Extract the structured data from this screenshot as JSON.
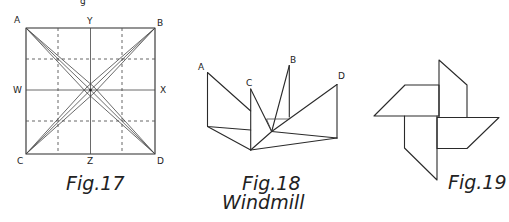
{
  "page": {
    "top_fragment": "g",
    "colors": {
      "ink": "#2a2a2a",
      "paper": "#ffffff"
    }
  },
  "figures": [
    {
      "id": "fig17",
      "caption": "Fig.17",
      "subcaption": "",
      "labels": {
        "A": "A",
        "B": "B",
        "C": "C",
        "D": "D",
        "W": "W",
        "X": "X",
        "Y": "Y",
        "Z": "Z"
      }
    },
    {
      "id": "fig18",
      "caption": "Fig.18",
      "subcaption": "Windmill",
      "labels": {
        "A": "A",
        "B": "B",
        "C": "C",
        "D": "D"
      }
    },
    {
      "id": "fig19",
      "caption": "Fig.19",
      "subcaption": ""
    }
  ]
}
